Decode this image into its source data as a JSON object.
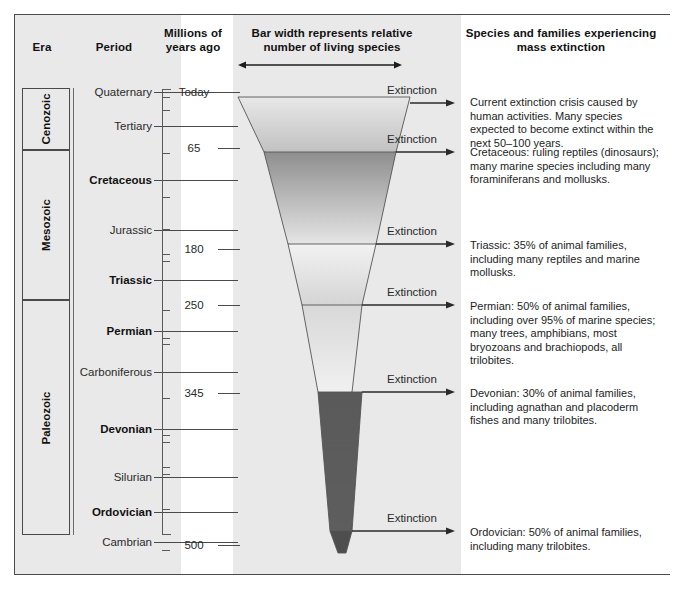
{
  "headers": {
    "era": "Era",
    "period": "Period",
    "myr": "Millions of\nyears ago",
    "bar": "Bar width represents relative\nnumber of living species",
    "species": "Species and families experiencing\nmass extinction"
  },
  "eras": [
    {
      "name": "Cenozoic",
      "top": 88,
      "height": 62
    },
    {
      "name": "Mesozoic",
      "top": 150,
      "height": 150
    },
    {
      "name": "Paleozoic",
      "top": 300,
      "height": 235
    }
  ],
  "periods": [
    {
      "label": "Quaternary",
      "bold": false,
      "y": 92
    },
    {
      "label": "Tertiary",
      "bold": false,
      "y": 126
    },
    {
      "label": "Cretaceous",
      "bold": true,
      "y": 180
    },
    {
      "label": "Jurassic",
      "bold": false,
      "y": 230
    },
    {
      "label": "Triassic",
      "bold": true,
      "y": 280
    },
    {
      "label": "Permian",
      "bold": true,
      "y": 331
    },
    {
      "label": "Carboniferous",
      "bold": false,
      "y": 372
    },
    {
      "label": "Devonian",
      "bold": true,
      "y": 429
    },
    {
      "label": "Silurian",
      "bold": false,
      "y": 477
    },
    {
      "label": "Ordovician",
      "bold": true,
      "y": 512
    },
    {
      "label": "Cambrian",
      "bold": false,
      "y": 542
    }
  ],
  "scale_labels": [
    {
      "value": "Today",
      "y": 92
    },
    {
      "value": "65",
      "y": 148
    },
    {
      "value": "180",
      "y": 249
    },
    {
      "value": "250",
      "y": 305
    },
    {
      "value": "345",
      "y": 393
    },
    {
      "value": "500",
      "y": 545
    }
  ],
  "ticks_y": [
    97,
    110,
    153,
    197,
    229,
    254,
    261,
    310,
    338,
    344,
    398,
    435,
    442,
    467,
    474,
    509,
    550
  ],
  "extinction_label": "Extinction",
  "extinctions": [
    {
      "label": "Extinction",
      "y": 91,
      "arrow_y": 103
    },
    {
      "label": "Extinction",
      "y": 140,
      "arrow_y": 152
    },
    {
      "label": "Extinction",
      "y": 232,
      "arrow_y": 244
    },
    {
      "label": "Extinction",
      "y": 293,
      "arrow_y": 305
    },
    {
      "label": "Extinction",
      "y": 380,
      "arrow_y": 392
    },
    {
      "label": "Extinction",
      "y": 519,
      "arrow_y": 531
    }
  ],
  "species_notes": [
    {
      "y": 96,
      "text": "Current extinction crisis caused by human activities. Many species expected to become extinct within the next 50–100 years."
    },
    {
      "y": 146,
      "text": "Cretaceous: ruling reptiles (dinosaurs); many marine species including many foraminiferans and mollusks."
    },
    {
      "y": 239,
      "text": "Triassic: 35% of animal families, including many reptiles and marine mollusks."
    },
    {
      "y": 300,
      "text": "Permian: 50% of animal families, including over 95% of marine species; many trees, amphibians, most bryozoans and brachiopods, all trilobites."
    },
    {
      "y": 387,
      "text": "Devonian: 30% of animal families, including agnathan and placoderm fishes and many trilobites."
    },
    {
      "y": 526,
      "text": "Ordovician: 50% of animal families, including many trilobites."
    }
  ],
  "chart_data": {
    "type": "area",
    "title": "Bar width represents relative number of living species",
    "xlabel": "Relative number of living species",
    "ylabel": "Millions of years ago",
    "ylim": [
      0,
      570
    ],
    "grid": false,
    "legend": "none",
    "axis_ticks": [
      "Today",
      "65",
      "180",
      "250",
      "345",
      "500"
    ],
    "segments": [
      {
        "name": "Cenozoic bar",
        "top_y": 97,
        "bottom_y": 152,
        "top_left_x": 238,
        "top_right_x": 410,
        "bottom_left_x": 264,
        "bottom_right_x": 396,
        "notch_y": 164,
        "fill_top": "#e8e8e8",
        "fill_bottom": "#b9b9b9"
      },
      {
        "name": "Cretaceous bar",
        "top_y": 152,
        "bottom_y": 244,
        "top_left_x": 264,
        "top_right_x": 396,
        "bottom_left_x": 288,
        "bottom_right_x": 376,
        "notch_y": 256,
        "fill_top": "#8e8e8e",
        "fill_bottom": "#f0f0f0"
      },
      {
        "name": "Triassic bar",
        "top_y": 244,
        "bottom_y": 305,
        "top_left_x": 288,
        "top_right_x": 376,
        "bottom_left_x": 302,
        "bottom_right_x": 362,
        "notch_y": 317,
        "fill_top": "#f2f2f2",
        "fill_bottom": "#cfcfcf"
      },
      {
        "name": "Permian bar",
        "top_y": 305,
        "bottom_y": 392,
        "top_left_x": 302,
        "top_right_x": 362,
        "bottom_left_x": 318,
        "bottom_right_x": 352,
        "notch_y": 404,
        "fill_top": "#d8d8d8",
        "fill_bottom": "#f4f4f4"
      },
      {
        "name": "Devonian bar",
        "top_y": 392,
        "bottom_y": 531,
        "top_left_x": 318,
        "top_right_x": 362,
        "bottom_left_x": 330,
        "bottom_right_x": 352,
        "notch_y": 543,
        "fill_top": "#5a5a5a",
        "fill_bottom": "#5e5e5e"
      },
      {
        "name": "Ordovician bar",
        "top_y": 531,
        "bottom_y": 553,
        "top_left_x": 330,
        "top_right_x": 352,
        "bottom_left_x": 338,
        "bottom_right_x": 346,
        "notch_y": 553,
        "fill_top": "#4e4e4e",
        "fill_bottom": "#4e4e4e"
      }
    ],
    "arrow_end_x": 455,
    "arrow_start_x": 400
  },
  "colors": {
    "band_gray": "#e9e9e9",
    "frame": "#4a4a4a",
    "ink": "#1d1d1d",
    "rule": "#5a5a5a"
  }
}
